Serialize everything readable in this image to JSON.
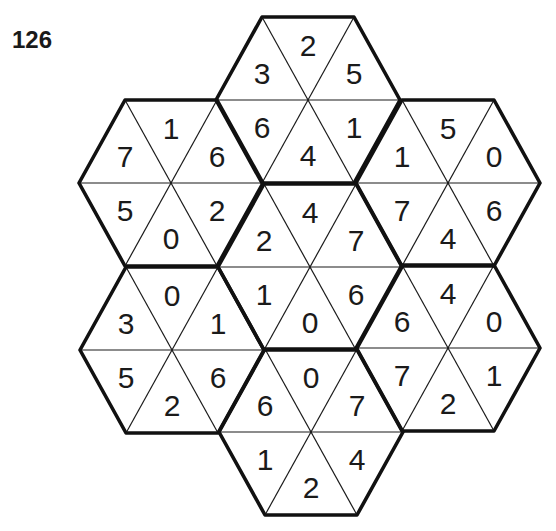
{
  "puzzle": {
    "number": "126",
    "line_color": "#111111",
    "background": "#ffffff",
    "hexagons": [
      {
        "name": "top",
        "center": [
          308,
          100
        ],
        "triangles": {
          "top": "2",
          "upper_right": "5",
          "lower_right": "1",
          "bottom": "4",
          "lower_left": "6",
          "upper_left": "3"
        }
      },
      {
        "name": "upper-left",
        "center": [
          171,
          183
        ],
        "triangles": {
          "top": "1",
          "upper_right": "6",
          "lower_right": "2",
          "bottom": "0",
          "lower_left": "5",
          "upper_left": "7"
        }
      },
      {
        "name": "upper-right",
        "center": [
          448,
          183
        ],
        "triangles": {
          "top": "5",
          "upper_right": "0",
          "lower_right": "6",
          "bottom": "4",
          "lower_left": "7",
          "upper_left": "1"
        }
      },
      {
        "name": "center",
        "center": [
          310,
          267
        ],
        "triangles": {
          "top": "4",
          "upper_right": "7",
          "lower_right": "6",
          "bottom": "0",
          "lower_left": "1",
          "upper_left": "2"
        }
      },
      {
        "name": "lower-left",
        "center": [
          172,
          350
        ],
        "triangles": {
          "top": "0",
          "upper_right": "1",
          "lower_right": "6",
          "bottom": "2",
          "lower_left": "5",
          "upper_left": "3"
        }
      },
      {
        "name": "lower-right",
        "center": [
          448,
          348
        ],
        "triangles": {
          "top": "4",
          "upper_right": "0",
          "lower_right": "1",
          "bottom": "2",
          "lower_left": "7",
          "upper_left": "6"
        }
      },
      {
        "name": "bottom",
        "center": [
          311,
          432
        ],
        "triangles": {
          "top": "0",
          "upper_right": "7",
          "lower_right": "4",
          "bottom": "2",
          "lower_left": "1",
          "upper_left": "6"
        }
      }
    ]
  }
}
